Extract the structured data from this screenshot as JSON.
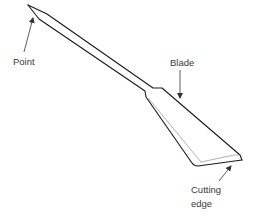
{
  "diagram": {
    "labels": {
      "point": "Point",
      "blade": "Blade",
      "cutting_edge_line1": "Cutting",
      "cutting_edge_line2": "edge"
    },
    "colors": {
      "stroke": "#1a1a1a",
      "label_text": "#3a3a3a",
      "background": "#ffffff"
    }
  }
}
